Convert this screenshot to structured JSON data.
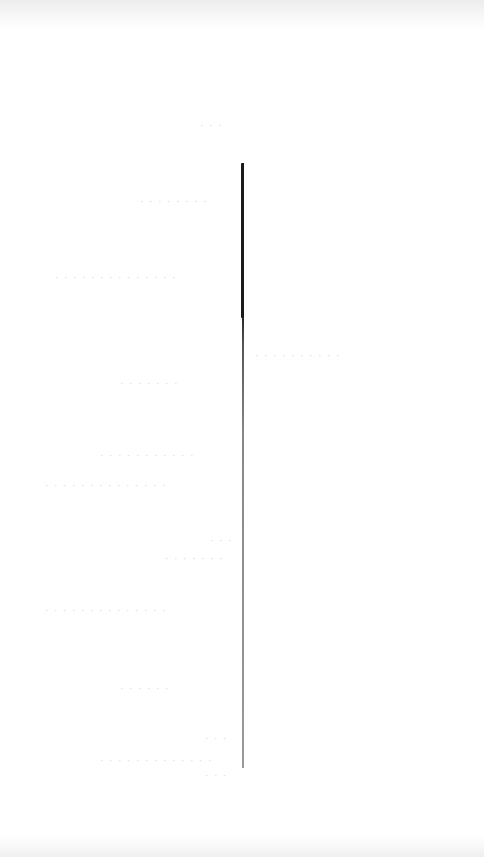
{
  "document": {
    "type": "scanned-page",
    "legibility": "text too faint to read",
    "text_blocks": [
      {
        "id": "heading-small",
        "text": "· · ·"
      },
      {
        "id": "title-line",
        "text": "· · · · · · · ·"
      },
      {
        "id": "wide-line-1",
        "text": "· · · · · · · · · · · · · ·"
      },
      {
        "id": "line-2",
        "text": "· · · · · · · · · ·"
      },
      {
        "id": "line-3",
        "text": "· · · · · · ·"
      },
      {
        "id": "line-4",
        "text": "· · · · · · · · · · ·"
      },
      {
        "id": "line-5",
        "text": "· · · · · · · · · · · · · ·"
      },
      {
        "id": "center-block-1",
        "text": "· · ·"
      },
      {
        "id": "center-block-2",
        "text": "· · · · · · ·"
      },
      {
        "id": "line-6",
        "text": "· · · · · · · · · · · · · ·"
      },
      {
        "id": "line-7",
        "text": "· · · · · ·"
      },
      {
        "id": "footer-block-1",
        "text": "· · ·"
      },
      {
        "id": "footer-block-2",
        "text": "· · · · · · · · · · · · ·"
      },
      {
        "id": "footer-block-3",
        "text": "· · ·"
      }
    ],
    "colors": {
      "paper": "#ffffff",
      "rule": "#1a1a1a",
      "faint_text": "#e4e4e4"
    }
  }
}
